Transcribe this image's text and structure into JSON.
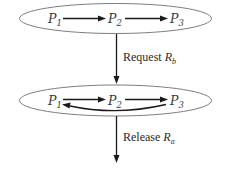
{
  "diagram": {
    "type": "state-transition",
    "colors": {
      "ellipse_stroke": "#6e6e6e",
      "arrow": "#1a1a1a",
      "text": "#3a3a3a",
      "background": "#ffffff"
    },
    "states": [
      {
        "id": "state-top",
        "nodes": [
          {
            "letter": "P",
            "sub": "1"
          },
          {
            "letter": "P",
            "sub": "2"
          },
          {
            "letter": "P",
            "sub": "3"
          }
        ],
        "edges": [
          {
            "from": "P1",
            "to": "P2"
          },
          {
            "from": "P2",
            "to": "P3"
          }
        ]
      },
      {
        "id": "state-bottom",
        "nodes": [
          {
            "letter": "P",
            "sub": "1"
          },
          {
            "letter": "P",
            "sub": "2"
          },
          {
            "letter": "P",
            "sub": "3"
          }
        ],
        "edges": [
          {
            "from": "P1",
            "to": "P2"
          },
          {
            "from": "P2",
            "to": "P3"
          },
          {
            "from": "P3",
            "to": "P1",
            "style": "curved"
          }
        ]
      }
    ],
    "transitions": [
      {
        "action": "Request",
        "resource_letter": "R",
        "resource_sub": "b"
      },
      {
        "action": "Release",
        "resource_letter": "R",
        "resource_sub": "a"
      }
    ]
  }
}
